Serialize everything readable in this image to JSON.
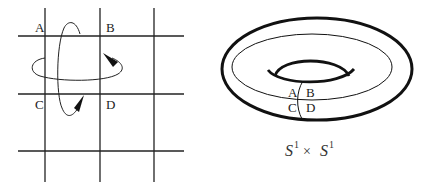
{
  "grid_panel": {
    "labels": {
      "a": "A",
      "b": "B",
      "c": "C",
      "d": "D"
    }
  },
  "torus_panel": {
    "labels": {
      "a": "A",
      "b": "B",
      "c": "C",
      "d": "D"
    },
    "caption": {
      "base1": "S",
      "sup1": "1",
      "operator": "×",
      "base2": "S",
      "sup2": "1"
    }
  },
  "colors": {
    "stroke": "#222222",
    "background": "#ffffff"
  }
}
